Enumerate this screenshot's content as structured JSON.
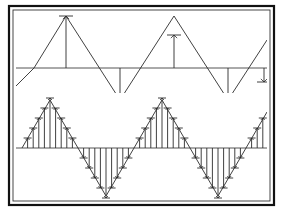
{
  "figure": {
    "title": "",
    "frame": {
      "outer": {
        "x": 9,
        "y": 6,
        "w": 265,
        "h": 199,
        "stroke": "#111111",
        "stroke_width": 2.2
      },
      "inner": {
        "x": 13,
        "y": 10,
        "w": 257,
        "h": 191,
        "stroke": "#333333",
        "stroke_width": 0.9
      },
      "divider_visible": false
    },
    "colors": {
      "ink": "#2b2b2b",
      "ink_dark": "#111111",
      "axis": "#555555",
      "background": "#ffffff"
    }
  },
  "chart_data": [
    {
      "type": "line",
      "name": "coarse-sampled-triangle-wave",
      "title": "",
      "xlabel": "",
      "ylabel": "",
      "grid": false,
      "legend": null,
      "panel": {
        "x": 16,
        "y": 12,
        "w": 251,
        "h": 80
      },
      "baseline_y": 68,
      "amplitude_px": 52,
      "xlim": [
        0,
        251
      ],
      "ylim": [
        -1.35,
        1.35
      ],
      "waveform": {
        "shape": "triangle",
        "period_px": 108,
        "phase_offset_px": -8,
        "peak_value": 1.0,
        "trough_value": -1.0,
        "vertices_px": [
          {
            "x": 16,
            "y": 86
          },
          {
            "x": 34,
            "y": 68
          },
          {
            "x": 66,
            "y": 16
          },
          {
            "x": 120,
            "y": 100
          },
          {
            "x": 174,
            "y": 16
          },
          {
            "x": 228,
            "y": 100
          },
          {
            "x": 267,
            "y": 40
          }
        ]
      },
      "samples": {
        "style": "stem-arrow",
        "count": 5,
        "x": [
          66,
          120,
          174,
          228,
          264
        ],
        "values": [
          1.0,
          -0.62,
          0.62,
          -0.62,
          -0.52
        ],
        "y_tip_px": [
          16,
          100,
          35,
          100,
          82
        ],
        "arrow_tick_halfwidth_px": 7
      }
    },
    {
      "type": "line",
      "name": "fine-sampled-triangle-wave",
      "title": "",
      "xlabel": "",
      "ylabel": "",
      "grid": false,
      "legend": null,
      "panel": {
        "x": 16,
        "y": 96,
        "w": 251,
        "h": 102
      },
      "baseline_y": 148,
      "amplitude_px": 50,
      "xlim": [
        0,
        251
      ],
      "ylim": [
        -1.2,
        1.2
      ],
      "waveform": {
        "shape": "triangle",
        "period_px": 112,
        "phase_offset_px": -22,
        "peak_value": 1.0,
        "trough_value": -1.0,
        "vertices_px": [
          {
            "x": 22,
            "y": 148
          },
          {
            "x": 50,
            "y": 100
          },
          {
            "x": 106,
            "y": 196
          },
          {
            "x": 162,
            "y": 100
          },
          {
            "x": 218,
            "y": 196
          },
          {
            "x": 267,
            "y": 112
          }
        ]
      },
      "samples": {
        "style": "stem-arrow",
        "count": 44,
        "sample_spacing_px": 5.6,
        "first_sample_x": 22,
        "arrow_tick_halfwidth_px": 4,
        "x": [
          22,
          27.6,
          33.2,
          38.8,
          44.4,
          50,
          55.6,
          61.2,
          66.8,
          72.4,
          78,
          83.6,
          89.2,
          94.8,
          100.4,
          106,
          111.6,
          117.2,
          122.8,
          128.4,
          134,
          139.6,
          145.2,
          150.8,
          156.4,
          162,
          167.6,
          173.2,
          178.8,
          184.4,
          190,
          195.6,
          201.2,
          206.8,
          212.4,
          218,
          223.6,
          229.2,
          234.8,
          240.4,
          246,
          251.6,
          257.2,
          262.8
        ],
        "values": [
          0.0,
          0.2,
          0.4,
          0.6,
          0.8,
          1.0,
          0.8,
          0.6,
          0.4,
          0.2,
          0.0,
          -0.2,
          -0.4,
          -0.6,
          -0.8,
          -1.0,
          -0.8,
          -0.6,
          -0.4,
          -0.2,
          0.0,
          0.2,
          0.4,
          0.6,
          0.8,
          1.0,
          0.8,
          0.6,
          0.4,
          0.2,
          0.0,
          -0.2,
          -0.4,
          -0.6,
          -0.8,
          -1.0,
          -0.8,
          -0.6,
          -0.4,
          -0.2,
          0.0,
          0.2,
          0.4,
          0.6
        ]
      }
    }
  ]
}
